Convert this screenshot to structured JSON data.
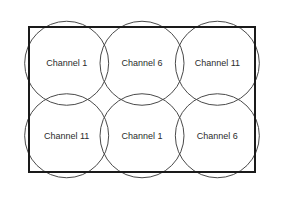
{
  "figure": {
    "background_color": "#ffffff",
    "rect_stroke_color": "#1a1a1a",
    "circle_stroke_color": "#4a4a4a",
    "label_color": "#2b2b2b"
  },
  "geometry": {
    "rect": {
      "x": 29,
      "y": 27,
      "width": 226,
      "height": 145
    },
    "columns": 3,
    "rows": 2,
    "cell_width": 75.33,
    "cell_height": 72.5,
    "circle_radius": 42,
    "rect_stroke_width": 2,
    "circle_stroke_width": 1
  },
  "cells": [
    {
      "row": 0,
      "col": 0,
      "label": "Channel 1",
      "cx": 66.67,
      "cy": 63.25
    },
    {
      "row": 0,
      "col": 1,
      "label": "Channel 6",
      "cx": 142.0,
      "cy": 63.25
    },
    {
      "row": 0,
      "col": 2,
      "label": "Channel 11",
      "cx": 217.33,
      "cy": 63.25
    },
    {
      "row": 1,
      "col": 0,
      "label": "Channel 11",
      "cx": 66.67,
      "cy": 135.75
    },
    {
      "row": 1,
      "col": 1,
      "label": "Channel 1",
      "cx": 142.0,
      "cy": 135.75
    },
    {
      "row": 1,
      "col": 2,
      "label": "Channel 6",
      "cx": 217.33,
      "cy": 135.75
    }
  ]
}
